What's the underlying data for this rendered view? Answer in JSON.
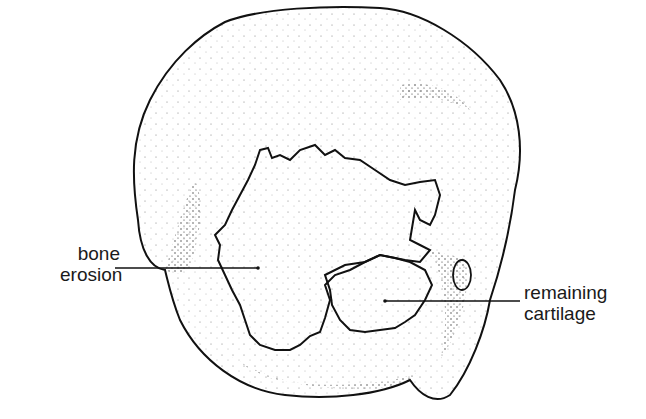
{
  "diagram": {
    "labels": [
      {
        "id": "bone-erosion",
        "lines": [
          "bone",
          "erosion"
        ]
      },
      {
        "id": "remaining-cartilage",
        "lines": [
          "remaining",
          "cartilage"
        ]
      }
    ],
    "colors": {
      "ink": "#1a1a1a",
      "background": "#ffffff"
    }
  }
}
